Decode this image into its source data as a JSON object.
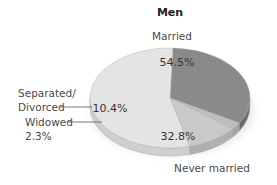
{
  "chart_data": {
    "type": "pie",
    "title": "Men",
    "slices": [
      {
        "name": "Married",
        "value": 54.5,
        "label": "54.5%",
        "color": "#e4e4e4",
        "side_color": "#cfcfcf"
      },
      {
        "name": "Never married",
        "value": 32.8,
        "label": "32.8%",
        "color": "#8a8a8a",
        "side_color": "#6c6c6c"
      },
      {
        "name": "Widowed",
        "value": 2.3,
        "label": "2.3%",
        "color": "#bdbdbd",
        "side_color": "#a5a5a5"
      },
      {
        "name": "Separated/ Divorced",
        "value": 10.4,
        "label": "10.4%",
        "color": "#c9c9c9",
        "side_color": "#b0b0b0"
      }
    ],
    "labels": {
      "married": "Married",
      "never_married": "Never married",
      "separated_line1": "Separated/",
      "separated_line2": "Divorced",
      "widowed_line1": "Widowed",
      "widowed_line2": "2.3%"
    },
    "percent_labels": {
      "married": "54.5%",
      "never_married": "32.8%",
      "separated": "10.4%"
    },
    "style": "3d-pie"
  }
}
